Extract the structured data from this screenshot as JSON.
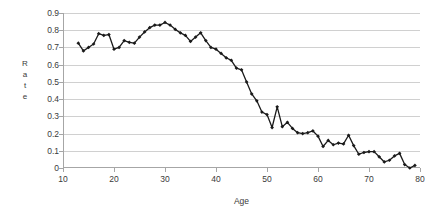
{
  "chart_data": {
    "type": "line",
    "title": "",
    "subtitle": "",
    "xlabel": "Age",
    "ylabel": "Rate",
    "xlim": [
      10,
      80
    ],
    "ylim": [
      0,
      0.9
    ],
    "xticks": [
      10,
      20,
      30,
      40,
      50,
      60,
      70,
      80
    ],
    "xtick_labels": [
      "10",
      "20",
      "30",
      "40",
      "50",
      "60",
      "70",
      "80"
    ],
    "yticks": [
      0,
      0.1,
      0.2,
      0.3,
      0.4,
      0.5,
      0.6,
      0.7,
      0.8,
      0.9
    ],
    "ytick_labels": [
      "0",
      "0.1",
      "0.2",
      "0.3",
      "0.4",
      "0.5",
      "0.6",
      "0.7",
      "0.8",
      "0.9"
    ],
    "grid": "horizontal",
    "legend": "none",
    "annotations": [],
    "series": [
      {
        "name": "Rate by Age",
        "marker": "diamond",
        "color": "#1a1a1a",
        "line_color": "#1a1a1a",
        "x": [
          13,
          14,
          15,
          16,
          17,
          18,
          19,
          20,
          21,
          22,
          23,
          24,
          25,
          26,
          27,
          28,
          29,
          30,
          31,
          32,
          33,
          34,
          35,
          36,
          37,
          38,
          39,
          40,
          41,
          42,
          43,
          44,
          45,
          46,
          47,
          48,
          49,
          50,
          51,
          52,
          53,
          54,
          55,
          56,
          57,
          58,
          59,
          60,
          61,
          62,
          63,
          64,
          65,
          66,
          67,
          68,
          69,
          70,
          71,
          72,
          73,
          74,
          75,
          76,
          77,
          78,
          79
        ],
        "y": [
          0.725,
          0.68,
          0.7,
          0.72,
          0.78,
          0.77,
          0.775,
          0.69,
          0.7,
          0.74,
          0.73,
          0.725,
          0.76,
          0.79,
          0.815,
          0.83,
          0.83,
          0.845,
          0.83,
          0.805,
          0.785,
          0.77,
          0.735,
          0.76,
          0.785,
          0.74,
          0.7,
          0.69,
          0.665,
          0.64,
          0.625,
          0.58,
          0.57,
          0.5,
          0.43,
          0.39,
          0.325,
          0.31,
          0.235,
          0.355,
          0.24,
          0.265,
          0.23,
          0.205,
          0.2,
          0.205,
          0.215,
          0.185,
          0.125,
          0.16,
          0.135,
          0.145,
          0.14,
          0.19,
          0.13,
          0.08,
          0.09,
          0.095,
          0.095,
          0.065,
          0.035,
          0.045,
          0.07,
          0.085,
          0.02,
          0.0,
          0.015
        ]
      }
    ]
  }
}
